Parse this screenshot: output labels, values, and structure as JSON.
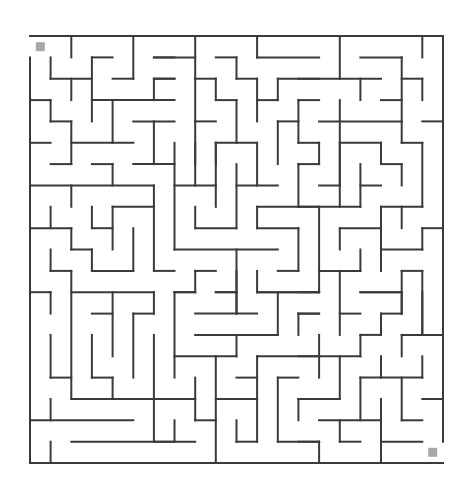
{
  "puzzle": {
    "type": "maze",
    "columns": 20,
    "rows": 20,
    "origin_px": [
      30,
      36
    ],
    "cell_px": [
      20.65,
      21.35
    ],
    "wall_color": "#3a3a3a",
    "marker_color": "#a8a8a8",
    "start": {
      "label": "start-marker",
      "cell": [
        0,
        0
      ]
    },
    "end": {
      "label": "end-marker",
      "cell": [
        19,
        19
      ]
    }
  },
  "walls": [
    [
      0,
      0,
      20,
      0
    ],
    [
      0,
      20,
      20,
      20
    ],
    [
      0,
      1,
      0,
      20
    ],
    [
      20,
      0,
      20,
      19
    ],
    [
      2,
      0,
      2,
      1
    ],
    [
      5,
      0,
      5,
      2
    ],
    [
      1,
      1,
      1,
      2
    ],
    [
      1,
      2,
      3,
      2
    ],
    [
      2,
      2,
      2,
      3
    ],
    [
      3,
      1,
      4,
      1
    ],
    [
      3,
      1,
      3,
      4
    ],
    [
      4,
      2,
      5,
      2
    ],
    [
      6,
      1,
      7,
      1
    ],
    [
      0,
      3,
      1,
      3
    ],
    [
      1,
      3,
      1,
      4
    ],
    [
      1,
      4,
      2,
      4
    ],
    [
      2,
      4,
      2,
      6
    ],
    [
      3,
      3,
      7,
      3
    ],
    [
      6,
      2,
      6,
      3
    ],
    [
      6,
      2,
      7,
      2
    ],
    [
      4,
      3,
      4,
      5
    ],
    [
      2,
      5,
      5,
      5
    ],
    [
      5,
      4,
      7,
      4
    ],
    [
      6,
      4,
      6,
      6
    ],
    [
      0,
      5,
      1,
      5
    ],
    [
      1,
      6,
      2,
      6
    ],
    [
      3,
      6,
      4,
      6
    ],
    [
      5,
      6,
      7,
      6
    ],
    [
      6,
      1,
      8,
      1
    ],
    [
      8,
      0,
      8,
      7
    ],
    [
      11,
      0,
      11,
      1
    ],
    [
      11,
      1,
      14,
      1
    ],
    [
      9,
      1,
      10,
      1
    ],
    [
      10,
      1,
      10,
      2
    ],
    [
      10,
      2,
      11,
      2
    ],
    [
      11,
      2,
      11,
      4
    ],
    [
      8,
      2,
      9,
      2
    ],
    [
      9,
      2,
      9,
      3
    ],
    [
      9,
      3,
      10,
      3
    ],
    [
      10,
      3,
      10,
      5
    ],
    [
      11,
      3,
      12,
      3
    ],
    [
      12,
      2,
      12,
      3
    ],
    [
      12,
      2,
      14,
      2
    ],
    [
      8,
      4,
      9,
      4
    ],
    [
      9,
      5,
      11,
      5
    ],
    [
      9,
      5,
      9,
      6
    ],
    [
      11,
      5,
      11,
      7
    ],
    [
      12,
      4,
      13,
      4
    ],
    [
      12,
      4,
      12,
      6
    ],
    [
      13,
      3,
      13,
      5
    ],
    [
      13,
      3,
      14,
      3
    ],
    [
      13,
      5,
      14,
      5
    ],
    [
      7,
      5,
      7,
      10
    ],
    [
      6,
      2,
      7,
      2
    ],
    [
      15,
      0,
      15,
      2
    ],
    [
      13,
      2,
      17,
      2
    ],
    [
      19,
      0,
      19,
      1
    ],
    [
      16,
      1,
      18,
      1
    ],
    [
      18,
      1,
      18,
      5
    ],
    [
      16,
      2,
      16,
      3
    ],
    [
      18,
      2,
      19,
      2
    ],
    [
      19,
      2,
      19,
      3
    ],
    [
      17,
      3,
      18,
      3
    ],
    [
      15,
      3,
      15,
      8
    ],
    [
      14,
      4,
      18,
      4
    ],
    [
      19,
      4,
      20,
      4
    ],
    [
      14,
      5,
      14,
      6
    ],
    [
      15,
      5,
      17,
      5
    ],
    [
      17,
      5,
      17,
      6
    ],
    [
      18,
      5,
      19,
      5
    ],
    [
      19,
      5,
      19,
      8
    ],
    [
      17,
      6,
      18,
      6
    ],
    [
      18,
      6,
      18,
      7
    ],
    [
      4,
      6,
      4,
      7
    ],
    [
      0,
      7,
      6,
      7
    ],
    [
      2,
      7,
      2,
      8
    ],
    [
      6,
      7,
      6,
      11
    ],
    [
      6,
      11,
      7,
      11
    ],
    [
      1,
      8,
      1,
      9
    ],
    [
      0,
      9,
      2,
      9
    ],
    [
      2,
      9,
      2,
      10
    ],
    [
      2,
      10,
      3,
      10
    ],
    [
      3,
      10,
      3,
      11
    ],
    [
      3,
      11,
      5,
      11
    ],
    [
      5,
      9,
      5,
      11
    ],
    [
      3,
      8,
      3,
      9
    ],
    [
      3,
      9,
      4,
      9
    ],
    [
      4,
      8,
      6,
      8
    ],
    [
      4,
      8,
      4,
      10
    ],
    [
      1,
      10,
      1,
      11
    ],
    [
      1,
      11,
      2,
      11
    ],
    [
      2,
      11,
      2,
      17
    ],
    [
      0,
      12,
      1,
      12
    ],
    [
      2,
      12,
      6,
      12
    ],
    [
      7,
      10,
      12,
      10
    ],
    [
      8,
      5,
      8,
      6
    ],
    [
      9,
      5,
      9,
      8
    ],
    [
      7,
      7,
      9,
      7
    ],
    [
      10,
      6,
      10,
      9
    ],
    [
      8,
      9,
      10,
      9
    ],
    [
      8,
      8,
      8,
      9
    ],
    [
      10,
      7,
      12,
      7
    ],
    [
      13,
      6,
      13,
      8
    ],
    [
      13,
      6,
      14,
      6
    ],
    [
      11,
      8,
      14,
      8
    ],
    [
      11,
      8,
      11,
      9
    ],
    [
      11,
      9,
      13,
      9
    ],
    [
      13,
      9,
      13,
      11
    ],
    [
      12,
      11,
      13,
      11
    ],
    [
      10,
      10,
      10,
      13
    ],
    [
      8,
      11,
      9,
      11
    ],
    [
      8,
      11,
      8,
      12
    ],
    [
      7,
      12,
      8,
      12
    ],
    [
      9,
      12,
      10,
      12
    ],
    [
      11,
      11,
      11,
      12
    ],
    [
      11,
      12,
      14,
      12
    ],
    [
      12,
      12,
      12,
      14
    ],
    [
      15,
      5,
      15,
      7
    ],
    [
      14,
      7,
      15,
      7
    ],
    [
      16,
      6,
      16,
      8
    ],
    [
      16,
      7,
      17,
      7
    ],
    [
      13,
      8,
      16,
      8
    ],
    [
      17,
      8,
      19,
      8
    ],
    [
      17,
      8,
      17,
      11
    ],
    [
      18,
      8,
      18,
      9
    ],
    [
      15,
      9,
      17,
      9
    ],
    [
      15,
      9,
      15,
      10
    ],
    [
      19,
      9,
      20,
      9
    ],
    [
      19,
      9,
      19,
      10
    ],
    [
      17,
      10,
      19,
      10
    ],
    [
      14,
      8,
      14,
      12
    ],
    [
      14,
      11,
      16,
      11
    ],
    [
      16,
      10,
      16,
      11
    ],
    [
      15,
      11,
      15,
      14
    ],
    [
      18,
      11,
      19,
      11
    ],
    [
      18,
      11,
      18,
      13
    ],
    [
      16,
      12,
      18,
      12
    ],
    [
      19,
      11,
      19,
      14
    ],
    [
      1,
      12,
      1,
      13
    ],
    [
      6,
      12,
      6,
      13
    ],
    [
      5,
      13,
      6,
      13
    ],
    [
      4,
      12,
      4,
      15
    ],
    [
      3,
      13,
      4,
      13
    ],
    [
      1,
      14,
      1,
      16
    ],
    [
      1,
      16,
      2,
      16
    ],
    [
      3,
      14,
      3,
      16
    ],
    [
      3,
      16,
      4,
      16
    ],
    [
      4,
      16,
      4,
      17
    ],
    [
      5,
      13,
      5,
      16
    ],
    [
      6,
      14,
      6,
      19
    ],
    [
      2,
      19,
      7,
      19
    ],
    [
      7,
      12,
      7,
      16
    ],
    [
      2,
      17,
      7,
      17
    ],
    [
      1,
      17,
      1,
      18
    ],
    [
      0,
      18,
      5,
      18
    ],
    [
      1,
      19,
      1,
      20
    ],
    [
      7,
      18,
      7,
      19
    ],
    [
      7,
      12,
      8,
      12
    ],
    [
      9,
      12,
      10,
      12
    ],
    [
      10,
      11,
      10,
      13
    ],
    [
      8,
      13,
      11,
      13
    ],
    [
      11,
      12,
      14,
      12
    ],
    [
      8,
      14,
      12,
      14
    ],
    [
      10,
      14,
      10,
      15
    ],
    [
      13,
      13,
      13,
      14
    ],
    [
      13,
      13,
      14,
      13
    ],
    [
      7,
      15,
      10,
      15
    ],
    [
      9,
      15,
      9,
      20
    ],
    [
      11,
      15,
      14,
      15
    ],
    [
      11,
      15,
      11,
      19
    ],
    [
      10,
      16,
      11,
      16
    ],
    [
      9,
      17,
      11,
      17
    ],
    [
      12,
      16,
      13,
      16
    ],
    [
      12,
      16,
      12,
      19
    ],
    [
      12,
      19,
      14,
      19
    ],
    [
      13,
      17,
      14,
      17
    ],
    [
      13,
      17,
      13,
      18
    ],
    [
      8,
      16,
      8,
      18
    ],
    [
      8,
      18,
      9,
      18
    ],
    [
      6,
      17,
      8,
      17
    ],
    [
      6,
      19,
      8,
      19
    ],
    [
      10,
      18,
      10,
      19
    ],
    [
      10,
      19,
      11,
      19
    ],
    [
      13,
      12,
      14,
      12
    ],
    [
      15,
      13,
      16,
      13
    ],
    [
      16,
      12,
      18,
      12
    ],
    [
      18,
      12,
      18,
      13
    ],
    [
      17,
      13,
      18,
      13
    ],
    [
      17,
      13,
      17,
      14
    ],
    [
      16,
      14,
      17,
      14
    ],
    [
      16,
      14,
      16,
      15
    ],
    [
      13,
      15,
      16,
      15
    ],
    [
      13,
      13,
      14,
      13
    ],
    [
      14,
      14,
      14,
      16
    ],
    [
      15,
      15,
      15,
      17
    ],
    [
      13,
      17,
      15,
      17
    ],
    [
      19,
      12,
      19,
      14
    ],
    [
      18,
      14,
      20,
      14
    ],
    [
      18,
      14,
      18,
      15
    ],
    [
      17,
      15,
      17,
      16
    ],
    [
      16,
      16,
      19,
      16
    ],
    [
      19,
      15,
      19,
      16
    ],
    [
      16,
      16,
      16,
      18
    ],
    [
      18,
      16,
      18,
      18
    ],
    [
      18,
      18,
      19,
      18
    ],
    [
      19,
      17,
      20,
      17
    ],
    [
      14,
      18,
      17,
      18
    ],
    [
      15,
      18,
      15,
      19
    ],
    [
      15,
      19,
      16,
      19
    ],
    [
      17,
      17,
      17,
      20
    ],
    [
      17,
      19,
      19,
      19
    ],
    [
      13,
      19,
      14,
      19
    ],
    [
      14,
      19,
      14,
      20
    ]
  ]
}
